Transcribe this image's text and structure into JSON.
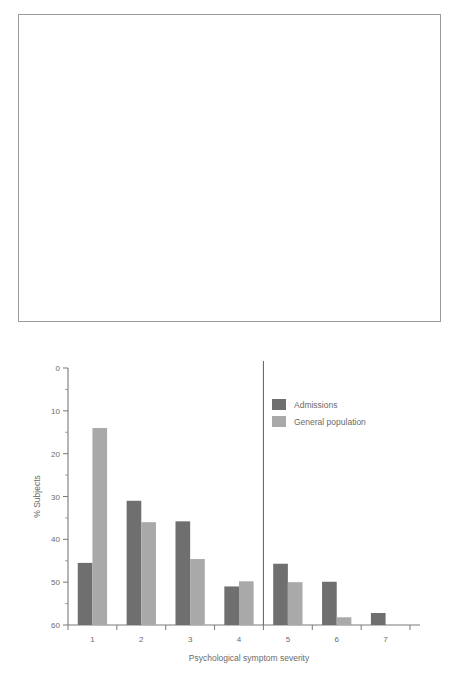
{
  "chart_data": [
    {
      "id": "distress-curves",
      "type": "line",
      "title": "",
      "xlabel": "Discress",
      "ylabel": "",
      "yunit": "%",
      "xlim": [
        1,
        7.8
      ],
      "ylim": [
        0,
        50
      ],
      "xticks": [
        1,
        2,
        3,
        4,
        5,
        6,
        7
      ],
      "yticks": [
        10,
        20,
        30,
        40,
        50
      ],
      "grid": false,
      "legend_position": "top-right",
      "reference_line_x": 5,
      "series": [
        {
          "name": "Acute threatening illness",
          "style": "solid",
          "x": [
            1.75,
            2.0,
            2.5,
            3.0,
            3.5,
            4.0,
            4.3,
            4.6,
            4.85,
            5.0,
            5.2,
            5.4,
            5.6,
            5.8,
            6.0,
            6.2,
            6.5,
            6.9,
            7.3,
            7.8
          ],
          "y": [
            0.0,
            2.2,
            8.0,
            13.5,
            20.0,
            28.0,
            33.5,
            38.0,
            40.0,
            39.4,
            36.5,
            31.0,
            25.0,
            18.0,
            11.5,
            8.0,
            5.4,
            3.4,
            1.8,
            0.2
          ]
        },
        {
          "name": "Chronic illness",
          "style": "dashdot",
          "x": [
            1.0,
            1.2,
            1.45,
            1.7,
            1.95,
            2.2,
            2.5,
            2.85,
            3.2,
            3.6,
            4.0,
            4.5,
            5.0,
            5.4,
            5.8,
            6.2,
            6.6,
            7.0,
            7.4,
            7.8
          ],
          "y": [
            15.0,
            20.5,
            25.0,
            27.0,
            26.2,
            24.0,
            21.0,
            17.5,
            15.0,
            13.2,
            12.0,
            10.4,
            9.0,
            8.7,
            8.0,
            6.8,
            5.4,
            4.0,
            2.4,
            0.5
          ]
        },
        {
          "name": "General population",
          "style": "dashed",
          "x": [
            1.0,
            1.2,
            1.45,
            1.65,
            1.85,
            2.05,
            2.3,
            2.6,
            2.9,
            3.2,
            3.6,
            4.0,
            4.5,
            5.0,
            5.5,
            6.0,
            6.5,
            7.0,
            7.4,
            7.8
          ],
          "y": [
            15.5,
            23.0,
            34.0,
            41.0,
            43.0,
            41.0,
            34.0,
            25.0,
            18.0,
            13.0,
            9.0,
            7.0,
            5.2,
            4.2,
            3.4,
            2.6,
            1.8,
            1.2,
            0.6,
            0.1
          ]
        }
      ]
    },
    {
      "id": "symptom-severity-bars",
      "type": "bar",
      "title": "",
      "xlabel": "Psychological symptom severity",
      "ylabel": "% Subjects",
      "categories": [
        "1",
        "2",
        "3",
        "4",
        "5",
        "6",
        "7"
      ],
      "xlim": [
        0.4,
        7.6
      ],
      "ylim": [
        0,
        60
      ],
      "yticks": [
        0,
        10,
        20,
        30,
        40,
        50,
        60
      ],
      "yticks_minor": [
        5,
        15,
        25,
        35,
        45,
        55
      ],
      "grid": false,
      "legend_position": "top-right",
      "reference_line_between": "4-5",
      "series": [
        {
          "name": "Admissions",
          "color": "#6f6f6f",
          "values": [
            14.5,
            29.0,
            24.2,
            9.0,
            14.3,
            10.1,
            2.8
          ]
        },
        {
          "name": "General population",
          "color": "#a9a9a9",
          "values": [
            46.0,
            24.0,
            15.4,
            10.2,
            10.0,
            1.8,
            0
          ]
        }
      ]
    }
  ],
  "top_chart": {
    "unit_label": "%",
    "xlabel": "Discress",
    "legend": [
      {
        "label": "Acute threatening illness",
        "style": "solid"
      },
      {
        "label": "Chronic illness",
        "style": "dashdot"
      },
      {
        "label": "General population",
        "style": "dashed"
      }
    ],
    "yticks": [
      "50",
      "40",
      "30",
      "20",
      "10"
    ],
    "xticks": [
      "1",
      "2",
      "3",
      "4",
      "5",
      "6",
      "7"
    ]
  },
  "bottom_chart": {
    "xlabel": "Psychological symptom severity",
    "ylabel": "% Subjects",
    "legend": [
      {
        "label": "Admissions",
        "color": "#6f6f6f"
      },
      {
        "label": "General population",
        "color": "#a9a9a9"
      }
    ],
    "yticks": [
      "60",
      "50",
      "40",
      "30",
      "20",
      "10",
      "0"
    ],
    "xticks": [
      "1",
      "2",
      "3",
      "4",
      "5",
      "6",
      "7"
    ]
  },
  "colors": {
    "ink": "#6b6b6b",
    "frame": "#9a9a9a",
    "curve": "#8e8e8e",
    "bar_dark": "#6f6f6f",
    "bar_light": "#a9a9a9",
    "background": "#ffffff"
  }
}
